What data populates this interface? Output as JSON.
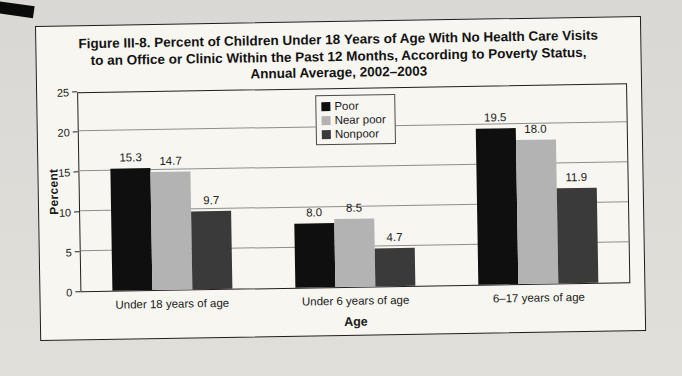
{
  "chart_data": {
    "type": "bar",
    "title": "Figure III-8. Percent of Children Under 18 Years of Age With No Health Care Visits to an Office or Clinic Within the Past 12 Months, According to Poverty Status, Annual Average, 2002–2003",
    "categories": [
      "Under 18 years of age",
      "Under 6 years of age",
      "6–17 years of age"
    ],
    "series": [
      {
        "name": "Poor",
        "color": "#0f0f0f",
        "values": [
          15.3,
          8.0,
          19.5
        ]
      },
      {
        "name": "Near poor",
        "color": "#b3b3b3",
        "values": [
          14.7,
          8.5,
          18.0
        ]
      },
      {
        "name": "Nonpoor",
        "color": "#3a3a3a",
        "values": [
          9.7,
          4.7,
          11.9
        ]
      }
    ],
    "xlabel": "Age",
    "ylabel": "Percent",
    "ylim": [
      0,
      25
    ],
    "ytick_step": 5,
    "grid": true,
    "legend_position": "top-center",
    "value_labels": true
  },
  "colors": {
    "paper": "#d9d8d4",
    "figure_bg": "#f7f6f1",
    "border": "#1c1c1c",
    "gridline": "#8d8d8d",
    "text": "#1a1a1a"
  }
}
